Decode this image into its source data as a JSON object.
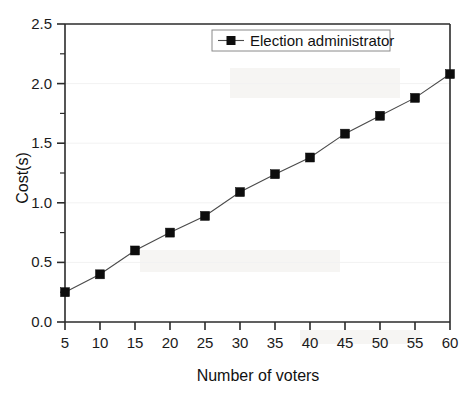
{
  "chart_data": {
    "type": "line",
    "title": "",
    "subtitle": "",
    "xlabel": "Number of voters",
    "ylabel": "Cost(s)",
    "x": [
      5,
      10,
      15,
      20,
      25,
      30,
      35,
      40,
      45,
      50,
      55,
      60
    ],
    "series": [
      {
        "name": "Election administrator",
        "values": [
          0.25,
          0.4,
          0.6,
          0.75,
          0.89,
          1.09,
          1.24,
          1.38,
          1.58,
          1.73,
          1.88,
          2.08
        ],
        "marker": "square",
        "color": "#0d0d0d"
      }
    ],
    "xlim": [
      5,
      60
    ],
    "ylim": [
      0.0,
      2.5
    ],
    "xticks": [
      5,
      10,
      15,
      20,
      25,
      30,
      35,
      40,
      45,
      50,
      55,
      60
    ],
    "xtick_labels": [
      "5",
      "10",
      "15",
      "20",
      "25",
      "30",
      "35",
      "40",
      "45",
      "50",
      "55",
      "60"
    ],
    "yticks": [
      0.0,
      0.5,
      1.0,
      1.5,
      2.0,
      2.5
    ],
    "ytick_labels": [
      "0.0",
      "0.5",
      "1.0",
      "1.5",
      "2.0",
      "2.5"
    ],
    "y_minor_ticks": [
      0.25,
      0.75,
      1.25,
      1.75,
      2.25
    ],
    "grid": false,
    "legend": {
      "position": "top-center",
      "entries": [
        "Election administrator"
      ]
    }
  },
  "figure": {
    "background_color": "#ffffff",
    "axis_color": "#2b2b2b",
    "line_color": "#4a4a4a",
    "marker_color": "#0d0d0d"
  }
}
